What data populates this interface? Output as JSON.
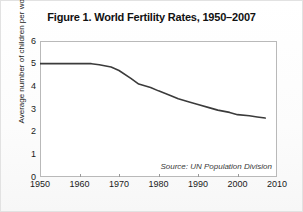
{
  "figure": {
    "title": "Figure 1. World Fertility Rates, 1950–2007",
    "source_note": "Source: UN Population Division",
    "line_color": "#3b3b3b",
    "frame_color": "#b9b9b9",
    "background": "#ffffff"
  },
  "chart_data": {
    "type": "line",
    "title": "Figure 1. World Fertility Rates, 1950–2007",
    "xlabel": "",
    "ylabel": "Average number of children per woman",
    "xlim": [
      1950,
      2010
    ],
    "ylim": [
      0,
      6
    ],
    "grid": false,
    "legend": "none",
    "annotations": [
      "Source: UN Population Division"
    ],
    "xticks": [
      1950,
      1960,
      1970,
      1980,
      1990,
      2000,
      2010
    ],
    "xtick_labels": [
      "1950",
      "1960",
      "1970",
      "1980",
      "1990",
      "2000",
      "2010"
    ],
    "yticks": [
      0,
      1,
      2,
      3,
      4,
      5,
      6
    ],
    "ytick_labels": [
      "0",
      "1",
      "2",
      "3",
      "4",
      "5",
      "6"
    ],
    "series": [
      {
        "name": "World total fertility rate",
        "x": [
          1950,
          1955,
          1960,
          1963,
          1965,
          1968,
          1970,
          1973,
          1975,
          1978,
          1980,
          1983,
          1985,
          1988,
          1990,
          1993,
          1995,
          1998,
          2000,
          2003,
          2005,
          2007
        ],
        "values": [
          5.0,
          5.0,
          5.0,
          5.0,
          4.95,
          4.85,
          4.7,
          4.35,
          4.1,
          3.95,
          3.8,
          3.6,
          3.45,
          3.3,
          3.2,
          3.05,
          2.95,
          2.85,
          2.75,
          2.7,
          2.65,
          2.6
        ]
      }
    ]
  }
}
